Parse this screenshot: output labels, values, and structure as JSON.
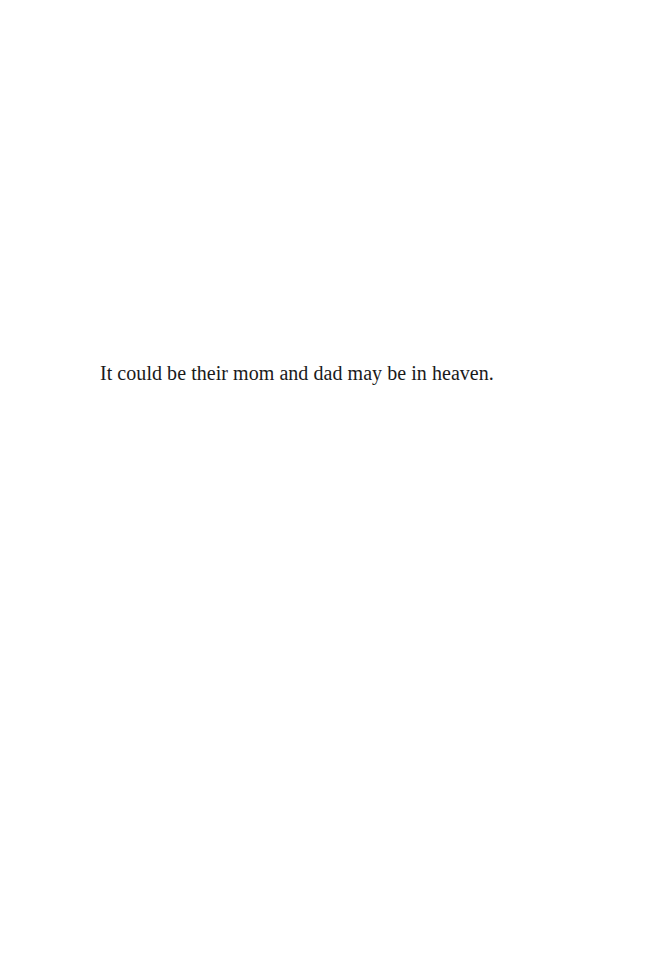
{
  "document": {
    "paragraphs": [
      {
        "text": "It could be their mom and dad may be in heaven."
      }
    ]
  }
}
